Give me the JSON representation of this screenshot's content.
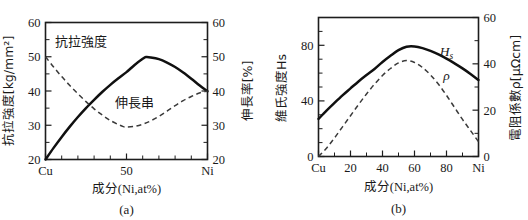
{
  "figure": {
    "background_color": "#ffffff",
    "ink_color": "#1a1a1a",
    "panel_a_caption": "(a)",
    "panel_b_caption": "(b)"
  },
  "chart_data": [
    {
      "type": "line",
      "panel": "a",
      "title": "",
      "caption": "(a)",
      "xlabel": "成分(Ni,at%)",
      "ylabel": "抗拉強度[kg/mm²]",
      "y2label": "伸長率[%]",
      "grid": false,
      "legend_position": "inline-annotation",
      "xlim": [
        0,
        100
      ],
      "ylim": [
        20,
        60
      ],
      "y2lim": [
        20,
        60
      ],
      "x_tick_values": [
        0,
        50,
        100
      ],
      "x_tick_labels": [
        "Cu",
        "50",
        "Ni"
      ],
      "x_minor_ticks": [
        10,
        20,
        30,
        40,
        60,
        70,
        80,
        90
      ],
      "y_tick_values": [
        20,
        30,
        40,
        50,
        60
      ],
      "y_tick_labels": [
        "20",
        "30",
        "40",
        "50",
        "60"
      ],
      "y_minor_ticks": [
        25,
        35,
        45,
        55
      ],
      "y2_tick_values": [
        20,
        30,
        40,
        50,
        60
      ],
      "y2_tick_labels": [
        "20",
        "30",
        "40",
        "50",
        "60"
      ],
      "y2_minor_ticks": [
        25,
        35,
        45,
        55
      ],
      "series": [
        {
          "name": "抗拉強度",
          "style": "solid",
          "axis": "left",
          "annotation": "抗拉強度",
          "annotation_x": 22,
          "annotation_y": 53.2,
          "x": [
            0,
            5,
            10,
            15,
            20,
            25,
            30,
            35,
            40,
            45,
            50,
            55,
            60,
            62,
            65,
            70,
            75,
            80,
            85,
            90,
            95,
            100
          ],
          "values": [
            20.0,
            23.4,
            26.6,
            29.6,
            32.4,
            35.0,
            37.4,
            39.7,
            41.8,
            43.7,
            45.5,
            47.6,
            49.4,
            49.9,
            49.8,
            49.3,
            48.3,
            47.0,
            45.4,
            43.6,
            41.7,
            39.9
          ]
        },
        {
          "name": "伸長率",
          "style": "dashed",
          "axis": "right",
          "annotation": "伸長串",
          "annotation_x": 55,
          "annotation_y": 35.2,
          "x": [
            0,
            5,
            10,
            15,
            20,
            25,
            30,
            35,
            40,
            45,
            48,
            50,
            55,
            60,
            65,
            70,
            75,
            80,
            85,
            90,
            95,
            100
          ],
          "values": [
            50.0,
            47.0,
            44.2,
            41.6,
            39.2,
            36.9,
            34.8,
            33.0,
            31.4,
            30.2,
            29.6,
            29.5,
            29.7,
            30.3,
            31.3,
            32.6,
            34.1,
            35.7,
            37.2,
            38.4,
            39.4,
            40.0
          ]
        }
      ]
    },
    {
      "type": "line",
      "panel": "b",
      "title": "",
      "caption": "(b)",
      "xlabel": "成分(Ni,at%)",
      "ylabel": "維氏強度Hs",
      "y2label": "電阻係數ρ[μΩcm]",
      "grid": false,
      "legend_position": "inline-annotation",
      "xlim": [
        0,
        100
      ],
      "ylim": [
        0,
        100
      ],
      "y2lim": [
        0,
        60
      ],
      "x_tick_values": [
        0,
        20,
        40,
        60,
        80,
        100
      ],
      "x_tick_labels": [
        "Cu",
        "20",
        "40",
        "60",
        "80",
        "Ni"
      ],
      "x_minor_ticks": [
        10,
        30,
        50,
        70,
        90
      ],
      "y_tick_values": [
        0,
        40,
        80
      ],
      "y_tick_labels": [
        "0",
        "40",
        "80"
      ],
      "y_minor_ticks": [
        10,
        20,
        30,
        50,
        60,
        70,
        90,
        100
      ],
      "y2_tick_values": [
        0,
        20,
        40,
        60
      ],
      "y2_tick_labels": [
        "0",
        "20",
        "40",
        "60"
      ],
      "y2_minor_ticks": [
        10,
        30,
        50
      ],
      "series": [
        {
          "name": "Hs",
          "style": "solid",
          "axis": "left",
          "annotation": "H",
          "annotation_sub": "s",
          "annotation_x": 80,
          "annotation_y": 72,
          "x": [
            0,
            5,
            10,
            15,
            20,
            25,
            30,
            35,
            40,
            45,
            50,
            55,
            60,
            65,
            70,
            75,
            80,
            85,
            90,
            95,
            100
          ],
          "values": [
            27.0,
            33.0,
            38.6,
            44.0,
            49.0,
            54.0,
            58.6,
            63.0,
            68.0,
            72.5,
            76.5,
            79.0,
            79.2,
            78.0,
            76.0,
            73.4,
            70.4,
            67.0,
            63.4,
            59.4,
            55.0
          ]
        },
        {
          "name": "ρ",
          "style": "dashed",
          "axis": "right",
          "annotation": "ρ",
          "annotation_x": 80,
          "annotation_y_right": 33,
          "x": [
            0,
            5,
            10,
            15,
            20,
            25,
            30,
            35,
            40,
            45,
            50,
            55,
            60,
            65,
            70,
            75,
            80,
            85,
            90,
            95,
            100
          ],
          "values": [
            0.0,
            3.6,
            8.0,
            12.8,
            17.6,
            22.4,
            27.0,
            31.2,
            35.0,
            38.0,
            40.4,
            41.4,
            40.6,
            38.4,
            35.2,
            31.2,
            26.4,
            21.2,
            16.0,
            11.2,
            6.4
          ]
        }
      ]
    }
  ]
}
